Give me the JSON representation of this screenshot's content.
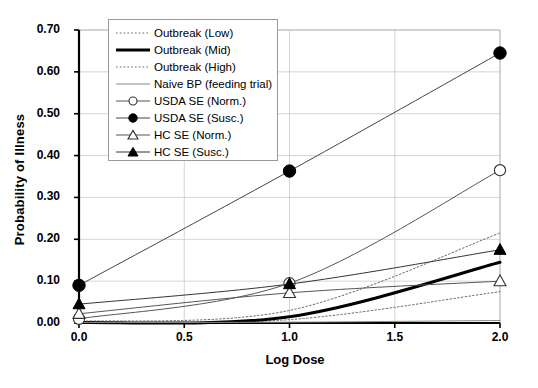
{
  "chart_data": {
    "type": "line",
    "title": "",
    "xlabel": "Log Dose",
    "ylabel": "Probability of Illness",
    "xlim": [
      0.0,
      2.0
    ],
    "ylim": [
      0.0,
      0.7
    ],
    "xticks": [
      "0.0",
      "0.5",
      "1.0",
      "1.5",
      "2.0"
    ],
    "xtick_values": [
      0.0,
      0.5,
      1.0,
      1.5,
      2.0
    ],
    "yticks": [
      "0.00",
      "0.10",
      "0.20",
      "0.30",
      "0.40",
      "0.50",
      "0.60",
      "0.70"
    ],
    "ytick_values": [
      0.0,
      0.1,
      0.2,
      0.3,
      0.4,
      0.5,
      0.6,
      0.7
    ],
    "grid": true,
    "legend_position": "upper-left-inside",
    "x": [
      0.0,
      1.0,
      2.0
    ],
    "series": [
      {
        "name": "Outbreak (Low)",
        "style": "dotted",
        "marker": "none",
        "color": "#666666",
        "width": 1,
        "values": [
          0.001,
          0.008,
          0.075
        ]
      },
      {
        "name": "Outbreak (Mid)",
        "style": "solid",
        "marker": "none",
        "color": "#000000",
        "width": 3,
        "values": [
          0.001,
          0.015,
          0.145
        ]
      },
      {
        "name": "Outbreak (High)",
        "style": "dotted",
        "marker": "none",
        "color": "#666666",
        "width": 1,
        "values": [
          0.004,
          0.03,
          0.215
        ]
      },
      {
        "name": "Naive BP (feeding trial)",
        "style": "solid",
        "marker": "none",
        "color": "#888888",
        "width": 1,
        "values": [
          0.001,
          0.002,
          0.006
        ]
      },
      {
        "name": "USDA SE (Norm.)",
        "style": "solid",
        "marker": "open-circle",
        "color": "#555555",
        "width": 1,
        "values": [
          0.01,
          0.095,
          0.365
        ]
      },
      {
        "name": "USDA SE (Susc.)",
        "style": "solid",
        "marker": "filled-circle",
        "color": "#444444",
        "width": 1,
        "values": [
          0.09,
          0.363,
          0.645
        ]
      },
      {
        "name": "HC SE (Norm.)",
        "style": "solid",
        "marker": "open-triangle",
        "color": "#555555",
        "width": 1,
        "values": [
          0.022,
          0.072,
          0.1
        ]
      },
      {
        "name": "HC SE (Susc.)",
        "style": "solid",
        "marker": "filled-triangle",
        "color": "#333333",
        "width": 1,
        "values": [
          0.045,
          0.093,
          0.175
        ]
      }
    ]
  }
}
